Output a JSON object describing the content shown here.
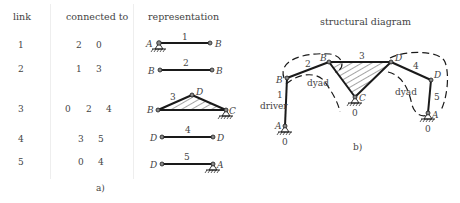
{
  "table": {
    "headers": {
      "link": "link",
      "connected_to": "connected to",
      "representation": "representation"
    },
    "rows": [
      {
        "link": "1",
        "connected": [
          "2",
          "0"
        ],
        "rep_label": "1",
        "rep_left": "A",
        "rep_right": "B"
      },
      {
        "link": "2",
        "connected": [
          "1",
          "3"
        ],
        "rep_label": "2",
        "rep_left": "B",
        "rep_right": "B"
      },
      {
        "link": "3",
        "connected": [
          "0",
          "2",
          "4"
        ],
        "rep_label": "3",
        "rep_left": "B",
        "rep_top": "D",
        "rep_right": "C"
      },
      {
        "link": "4",
        "connected": [
          "3",
          "5"
        ],
        "rep_label": "4",
        "rep_left": "D",
        "rep_right": "D"
      },
      {
        "link": "5",
        "connected": [
          "0",
          "4"
        ],
        "rep_label": "5",
        "rep_left": "D",
        "rep_right": "A"
      }
    ],
    "caption": "a)"
  },
  "structural": {
    "title": "structural diagram",
    "caption": "b)",
    "labels": {
      "link1": "1",
      "link2": "2",
      "link3": "3",
      "link4": "4",
      "link5": "5",
      "B_left": "B",
      "B_top": "B",
      "D_top": "D",
      "D_right": "D",
      "A_left": "A",
      "A_right": "A",
      "C": "C",
      "ground_left": "0",
      "ground_mid": "0",
      "ground_right": "0",
      "driver": "driver",
      "dyad_left": "dyad",
      "dyad_right": "dyad"
    }
  },
  "colors": {
    "line": "#1a1a1a",
    "text": "#444444",
    "divider": "#eeeeee"
  }
}
